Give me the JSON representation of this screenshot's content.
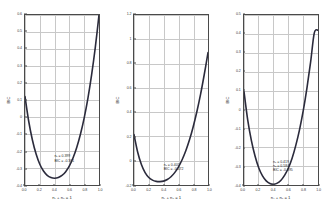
{
  "figure": {
    "background": "#ffffff",
    "curve_color": "#2b2b3c",
    "grid_color": "#c8c8c8",
    "frame_color": "#4a4a4a"
  },
  "chart_data": [
    {
      "type": "line",
      "title": "",
      "xlabel": "n₁ + n₂ = 1",
      "ylabel": "BIC",
      "xlim": [
        0.0,
        1.0
      ],
      "ylim": [
        -0.4,
        0.6
      ],
      "grid": true,
      "legend": "none",
      "xticks": [
        0.0,
        0.2,
        0.4,
        0.6,
        0.8,
        1.0
      ],
      "xticklabels": [
        "0.0",
        "0.2",
        "0.4",
        "0.6",
        "0.8",
        "1.0"
      ],
      "yticks": [
        -0.4,
        -0.3,
        -0.2,
        -0.1,
        0.0,
        0.1,
        0.2,
        0.3,
        0.4,
        0.5,
        0.6
      ],
      "yticklabels": [
        "-0.4",
        "-0.3",
        "-0.2",
        "-0.1",
        "0",
        "0.1",
        "0.2",
        "0.3",
        "0.4",
        "0.5",
        "0.6"
      ],
      "x": [
        0.0,
        0.05,
        0.1,
        0.15,
        0.2,
        0.25,
        0.3,
        0.35,
        0.4,
        0.45,
        0.5,
        0.55,
        0.6,
        0.65,
        0.7,
        0.75,
        0.8,
        0.85,
        0.9,
        0.95,
        1.0
      ],
      "y": [
        0.12,
        -0.025,
        -0.135,
        -0.218,
        -0.278,
        -0.318,
        -0.343,
        -0.356,
        -0.36,
        -0.356,
        -0.344,
        -0.322,
        -0.288,
        -0.24,
        -0.178,
        -0.1,
        -0.005,
        0.11,
        0.248,
        0.41,
        0.6
      ],
      "annotation": {
        "lines": [
          "n₁ = 0.399",
          "BIC = -0.361"
        ],
        "x": 0.4,
        "y": -0.215
      }
    },
    {
      "type": "line",
      "title": "",
      "xlabel": "n₁ + n₂ = 1",
      "ylabel": "BIC",
      "xlim": [
        0.0,
        1.0
      ],
      "ylim": [
        -0.2,
        1.2
      ],
      "grid": true,
      "legend": "none",
      "xticks": [
        0.0,
        0.2,
        0.4,
        0.6,
        0.8,
        1.0
      ],
      "xticklabels": [
        "0.0",
        "0.2",
        "0.4",
        "0.6",
        "0.8",
        "1.0"
      ],
      "yticks": [
        -0.2,
        0.0,
        0.2,
        0.4,
        0.6,
        0.8,
        1.0,
        1.2
      ],
      "yticklabels": [
        "-0.2",
        "0",
        "0.2",
        "0.4",
        "0.6",
        "0.8",
        "1",
        "1.2"
      ],
      "x": [
        0.0,
        0.05,
        0.1,
        0.15,
        0.2,
        0.25,
        0.3,
        0.35,
        0.4,
        0.45,
        0.5,
        0.55,
        0.6,
        0.65,
        0.7,
        0.75,
        0.8,
        0.85,
        0.9,
        0.95,
        1.0
      ],
      "y": [
        0.215,
        0.07,
        -0.032,
        -0.098,
        -0.138,
        -0.16,
        -0.17,
        -0.172,
        -0.168,
        -0.155,
        -0.132,
        -0.098,
        -0.052,
        0.008,
        0.082,
        0.172,
        0.28,
        0.405,
        0.548,
        0.712,
        0.89
      ],
      "annotation": {
        "lines": [
          "n₁ = 0.405",
          "BIC = -0.172"
        ],
        "x": 0.4,
        "y": -0.012
      }
    },
    {
      "type": "line",
      "title": "",
      "xlabel": "n₁ + n₂ = 1",
      "ylabel": "BIC",
      "xlim": [
        0.0,
        1.0
      ],
      "ylim": [
        -0.4,
        0.5
      ],
      "grid": true,
      "legend": "none",
      "xticks": [
        0.0,
        0.2,
        0.4,
        0.6,
        0.8,
        1.0
      ],
      "xticklabels": [
        "0.0",
        "0.2",
        "0.4",
        "0.6",
        "0.8",
        "1.0"
      ],
      "yticks": [
        -0.4,
        -0.3,
        -0.2,
        -0.1,
        0.0,
        0.1,
        0.2,
        0.3,
        0.4,
        0.5
      ],
      "yticklabels": [
        "-0.4",
        "-0.3",
        "-0.2",
        "-0.1",
        "0",
        "0.1",
        "0.2",
        "0.3",
        "0.4",
        "0.5"
      ],
      "x": [
        0.0,
        0.05,
        0.1,
        0.15,
        0.2,
        0.25,
        0.3,
        0.35,
        0.4,
        0.45,
        0.5,
        0.55,
        0.6,
        0.65,
        0.7,
        0.75,
        0.8,
        0.85,
        0.9,
        0.95,
        1.0
      ],
      "y": [
        0.095,
        -0.055,
        -0.165,
        -0.248,
        -0.31,
        -0.352,
        -0.378,
        -0.392,
        -0.396,
        -0.39,
        -0.375,
        -0.348,
        -0.31,
        -0.258,
        -0.19,
        -0.108,
        -0.008,
        0.112,
        0.25,
        0.405,
        0.42
      ],
      "annotation": {
        "lines": [
          "n₁ = 0.419",
          "n₂ = 0.584",
          "BIC = -0.395"
        ],
        "x": 0.4,
        "y": -0.262
      }
    }
  ]
}
